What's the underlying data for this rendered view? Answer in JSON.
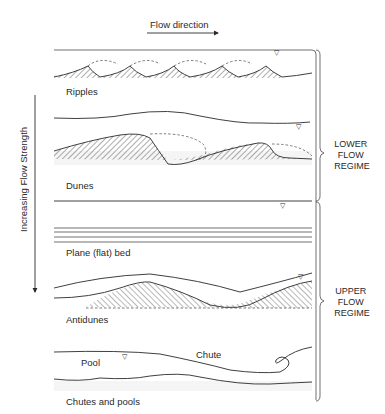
{
  "diagram": {
    "flow_direction_label": "Flow direction",
    "flow_strength_label": "Increasing Flow Strength",
    "regimes": [
      {
        "lines": [
          "LOWER",
          "FLOW",
          "REGIME"
        ],
        "covers": [
          "Ripples",
          "Dunes"
        ]
      },
      {
        "lines": [
          "UPPER",
          "FLOW",
          "REGIME"
        ],
        "covers": [
          "Plane (flat) bed",
          "Antidunes",
          "Chutes and pools"
        ]
      }
    ],
    "panels": [
      {
        "id": "ripples",
        "label": "Ripples"
      },
      {
        "id": "dunes",
        "label": "Dunes"
      },
      {
        "id": "plane-bed",
        "label": "Plane (flat) bed"
      },
      {
        "id": "antidunes",
        "label": "Antidunes"
      },
      {
        "id": "chutes-pools",
        "label": "Chutes and pools",
        "annotations": [
          "Pool",
          "Chute"
        ]
      }
    ],
    "water_surface_symbol": "▽"
  }
}
